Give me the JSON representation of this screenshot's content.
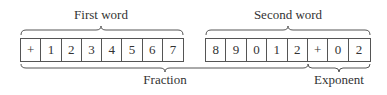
{
  "labels": {
    "first_word": "First word",
    "second_word": "Second word",
    "fraction": "Fraction",
    "exponent": "Exponent"
  },
  "first_word_cells": [
    "+",
    "1",
    "2",
    "3",
    "4",
    "5",
    "6",
    "7"
  ],
  "second_word_cells": [
    "8",
    "9",
    "0",
    "1",
    "2",
    "+",
    "0",
    "2"
  ]
}
